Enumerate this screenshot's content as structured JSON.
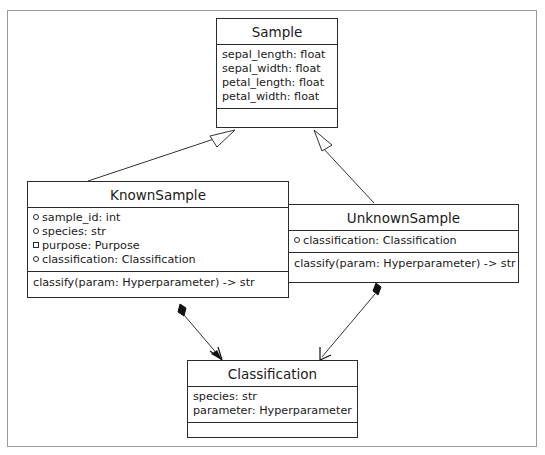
{
  "diagram": {
    "type": "uml-class-diagram",
    "classes": [
      {
        "name": "Sample",
        "attributes": [
          {
            "text": "sepal_length: float"
          },
          {
            "text": "sepal_width: float"
          },
          {
            "text": "petal_length: float"
          },
          {
            "text": "petal_width: float"
          }
        ],
        "operations": []
      },
      {
        "name": "KnownSample",
        "attributes": [
          {
            "visibility": "circle",
            "text": "sample_id: int"
          },
          {
            "visibility": "circle",
            "text": "species: str"
          },
          {
            "visibility": "square",
            "text": "purpose: Purpose"
          },
          {
            "visibility": "circle",
            "text": "classification: Classification"
          }
        ],
        "operations": [
          {
            "text": "classify(param: Hyperparameter) -> str"
          }
        ]
      },
      {
        "name": "UnknownSample",
        "attributes": [
          {
            "visibility": "circle",
            "text": "classification: Classification"
          }
        ],
        "operations": [
          {
            "text": "classify(param: Hyperparameter) -> str"
          }
        ]
      },
      {
        "name": "Classification",
        "attributes": [
          {
            "text": "species: str"
          },
          {
            "text": "parameter: Hyperparameter"
          }
        ],
        "operations": []
      }
    ],
    "relationships": [
      {
        "type": "generalization",
        "from": "KnownSample",
        "to": "Sample"
      },
      {
        "type": "generalization",
        "from": "UnknownSample",
        "to": "Sample"
      },
      {
        "type": "composition",
        "from": "KnownSample",
        "to": "Classification"
      },
      {
        "type": "composition",
        "from": "UnknownSample",
        "to": "Classification"
      }
    ]
  }
}
